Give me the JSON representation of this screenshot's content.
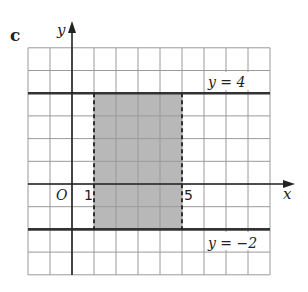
{
  "part_label": "c",
  "axes": {
    "x_label": "x",
    "y_label": "y",
    "origin_label": "O"
  },
  "grid": {
    "x_min": -2,
    "x_max": 9,
    "y_min": -4,
    "y_max": 6,
    "origin_px": [
      72,
      184
    ],
    "cell_w": 22.0,
    "cell_h": 22.7
  },
  "lines": [
    {
      "equation": "y = 4",
      "y": 4,
      "label": "y = 4"
    },
    {
      "equation": "y = -2",
      "y": -2,
      "label": "y = −2"
    }
  ],
  "boundaries": [
    {
      "x": 1,
      "style": "dashed",
      "tick_label": "1"
    },
    {
      "x": 5,
      "style": "dashed",
      "tick_label": "5"
    }
  ],
  "shaded_region": {
    "x_from": 1,
    "x_to": 5,
    "y_from": -2,
    "y_to": 4,
    "description": "1 < x < 5, -2 ≤ y ≤ 4",
    "fill": "#b8b8b8"
  },
  "colors": {
    "grid": "#9a9a9a",
    "axis": "#222222",
    "thick_line": "#333333",
    "shade": "#b8b8b8"
  }
}
